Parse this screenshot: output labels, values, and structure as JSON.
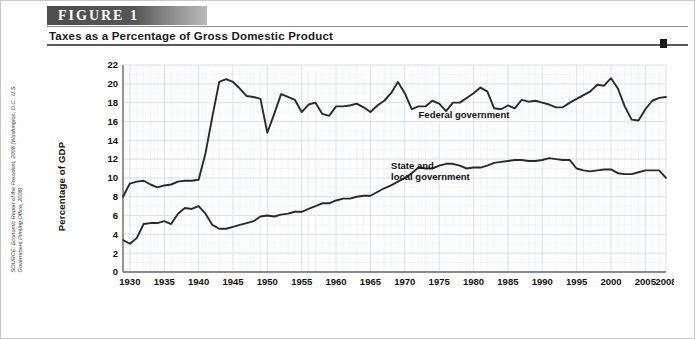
{
  "figure": {
    "badge_label": "FIGURE 1",
    "title": "Taxes as a Percentage of Gross Domestic Product",
    "source": "SOURCE: Economic Report of the President, 2008 (Washington, D.C.: U.S. Government Printing Office, 2008)"
  },
  "chart_data": {
    "type": "line",
    "title": "Taxes as a Percentage of Gross Domestic Product",
    "xlabel": "",
    "ylabel": "Percentage of GDP",
    "xlim": [
      1929,
      2008
    ],
    "ylim": [
      0,
      22
    ],
    "ytick_labels": [
      "0",
      "2",
      "4",
      "6",
      "8",
      "10",
      "12",
      "14",
      "16",
      "18",
      "20",
      "22"
    ],
    "ytick_values": [
      0,
      2,
      4,
      6,
      8,
      10,
      12,
      14,
      16,
      18,
      20,
      22
    ],
    "xtick_labels": [
      "1930",
      "1935",
      "1940",
      "1945",
      "1950",
      "1955",
      "1960",
      "1965",
      "1970",
      "1975",
      "1980",
      "1985",
      "1990",
      "1995",
      "2000",
      "2005",
      "2008"
    ],
    "xtick_values": [
      1930,
      1935,
      1940,
      1945,
      1950,
      1955,
      1960,
      1965,
      1970,
      1975,
      1980,
      1985,
      1990,
      1995,
      2000,
      2005,
      2008
    ],
    "grid": true,
    "legend_position": "inline-annotation",
    "annotations": [
      {
        "text": "Federal government",
        "x": 1972,
        "y": 16.4
      },
      {
        "text": "State and local government",
        "x": 1968,
        "y": 11.0
      }
    ],
    "series": [
      {
        "name": "Federal government",
        "label": "Federal government",
        "color": "#2a2a2a",
        "x": [
          1929,
          1930,
          1931,
          1932,
          1933,
          1934,
          1935,
          1936,
          1937,
          1938,
          1939,
          1940,
          1941,
          1942,
          1943,
          1944,
          1945,
          1946,
          1947,
          1948,
          1949,
          1950,
          1951,
          1952,
          1953,
          1954,
          1955,
          1956,
          1957,
          1958,
          1959,
          1960,
          1961,
          1962,
          1963,
          1964,
          1965,
          1966,
          1967,
          1968,
          1969,
          1970,
          1971,
          1972,
          1973,
          1974,
          1975,
          1976,
          1977,
          1978,
          1979,
          1980,
          1981,
          1982,
          1983,
          1984,
          1985,
          1986,
          1987,
          1988,
          1989,
          1990,
          1991,
          1992,
          1993,
          1994,
          1995,
          1996,
          1997,
          1998,
          1999,
          2000,
          2001,
          2002,
          2003,
          2004,
          2005,
          2006,
          2007,
          2008
        ],
        "values": [
          8.0,
          9.4,
          9.6,
          9.7,
          9.3,
          9.0,
          9.2,
          9.3,
          9.6,
          9.7,
          9.7,
          9.8,
          12.6,
          16.5,
          20.2,
          20.5,
          20.2,
          19.5,
          18.7,
          18.6,
          18.4,
          14.8,
          16.8,
          18.9,
          18.6,
          18.3,
          17.0,
          17.8,
          18.0,
          16.8,
          16.6,
          17.6,
          17.6,
          17.7,
          17.9,
          17.5,
          17.0,
          17.7,
          18.2,
          19.0,
          20.2,
          19.0,
          17.3,
          17.6,
          17.6,
          18.2,
          17.9,
          17.1,
          18.0,
          18.0,
          18.5,
          19.0,
          19.6,
          19.2,
          17.4,
          17.3,
          17.7,
          17.4,
          18.3,
          18.1,
          18.2,
          18.0,
          17.8,
          17.5,
          17.5,
          18.0,
          18.4,
          18.8,
          19.2,
          19.9,
          19.8,
          20.6,
          19.5,
          17.6,
          16.2,
          16.1,
          17.3,
          18.2,
          18.5,
          18.6
        ]
      },
      {
        "name": "State and local government",
        "label": "State and local government",
        "color": "#2a2a2a",
        "x": [
          1929,
          1930,
          1931,
          1932,
          1933,
          1934,
          1935,
          1936,
          1937,
          1938,
          1939,
          1940,
          1941,
          1942,
          1943,
          1944,
          1945,
          1946,
          1947,
          1948,
          1949,
          1950,
          1951,
          1952,
          1953,
          1954,
          1955,
          1956,
          1957,
          1958,
          1959,
          1960,
          1961,
          1962,
          1963,
          1964,
          1965,
          1966,
          1967,
          1968,
          1969,
          1970,
          1971,
          1972,
          1973,
          1974,
          1975,
          1976,
          1977,
          1978,
          1979,
          1980,
          1981,
          1982,
          1983,
          1984,
          1985,
          1986,
          1987,
          1988,
          1989,
          1990,
          1991,
          1992,
          1993,
          1994,
          1995,
          1996,
          1997,
          1998,
          1999,
          2000,
          2001,
          2002,
          2003,
          2004,
          2005,
          2006,
          2007,
          2008
        ],
        "values": [
          3.4,
          3.0,
          3.6,
          5.1,
          5.2,
          5.2,
          5.4,
          5.1,
          6.2,
          6.8,
          6.7,
          7.0,
          6.2,
          5.0,
          4.6,
          4.6,
          4.8,
          5.0,
          5.2,
          5.4,
          5.9,
          6.0,
          5.9,
          6.1,
          6.2,
          6.4,
          6.4,
          6.7,
          7.0,
          7.3,
          7.3,
          7.6,
          7.8,
          7.8,
          8.0,
          8.1,
          8.1,
          8.5,
          8.9,
          9.2,
          9.6,
          10.0,
          10.5,
          11.1,
          11.0,
          11.0,
          11.3,
          11.5,
          11.5,
          11.3,
          11.0,
          11.1,
          11.1,
          11.3,
          11.6,
          11.7,
          11.8,
          11.9,
          11.9,
          11.8,
          11.8,
          11.9,
          12.1,
          12.0,
          11.9,
          11.9,
          11.0,
          10.8,
          10.7,
          10.8,
          10.9,
          10.9,
          10.5,
          10.4,
          10.4,
          10.6,
          10.8,
          10.8,
          10.8,
          10.0
        ]
      }
    ]
  }
}
